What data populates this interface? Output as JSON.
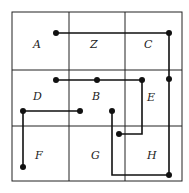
{
  "diagram": {
    "type": "grid-wiring",
    "rows": 3,
    "cols": 3,
    "cells": [
      {
        "label": "A",
        "row": 0,
        "col": 0
      },
      {
        "label": "Z",
        "row": 0,
        "col": 1
      },
      {
        "label": "C",
        "row": 0,
        "col": 2
      },
      {
        "label": "D",
        "row": 1,
        "col": 0
      },
      {
        "label": "B",
        "row": 1,
        "col": 1
      },
      {
        "label": "E",
        "row": 1,
        "col": 2
      },
      {
        "label": "F",
        "row": 2,
        "col": 0
      },
      {
        "label": "G",
        "row": 2,
        "col": 1
      },
      {
        "label": "H",
        "row": 2,
        "col": 2
      }
    ],
    "colors": {
      "line": "#111111",
      "background": "#ffffff"
    }
  }
}
